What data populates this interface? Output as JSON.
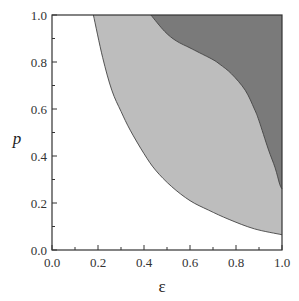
{
  "chart_data": {
    "type": "area",
    "title": "",
    "xlabel": "ε",
    "ylabel": "p",
    "xlim": [
      0.0,
      1.0
    ],
    "ylim": [
      0.0,
      1.0
    ],
    "xticks": [
      "0.0",
      "0.2",
      "0.4",
      "0.6",
      "0.8",
      "1.0"
    ],
    "yticks": [
      "0.0",
      "0.2",
      "0.4",
      "0.6",
      "0.8",
      "1.0"
    ],
    "grid": false,
    "legend": null,
    "series": [
      {
        "name": "light-region-boundary",
        "fill_color": "#bdbdbd",
        "description": "Lower/left boundary of light gray region (region extends up-right to top/right frame)",
        "x": [
          0.18,
          0.22,
          0.26,
          0.3,
          0.34,
          0.4,
          0.45,
          0.52,
          0.6,
          0.68,
          0.77,
          0.88,
          1.0
        ],
        "y": [
          1.0,
          0.82,
          0.68,
          0.59,
          0.51,
          0.41,
          0.34,
          0.27,
          0.21,
          0.17,
          0.13,
          0.09,
          0.065
        ]
      },
      {
        "name": "dark-region-boundary",
        "fill_color": "#7a7a7a",
        "description": "Lower/left boundary of dark gray region (region extends to top/right frame)",
        "x": [
          0.43,
          0.49,
          0.54,
          0.6,
          0.64,
          0.7,
          0.73,
          0.78,
          0.84,
          0.88,
          0.9,
          0.94,
          0.97,
          0.99,
          1.0
        ],
        "y": [
          1.0,
          0.93,
          0.89,
          0.86,
          0.84,
          0.81,
          0.79,
          0.75,
          0.68,
          0.6,
          0.55,
          0.43,
          0.35,
          0.28,
          0.26
        ]
      }
    ],
    "colors": {
      "background": "#ffffff",
      "light_region": "#bdbdbd",
      "dark_region": "#7a7a7a",
      "boundary_line": "#444444",
      "axis": "#333333"
    }
  }
}
